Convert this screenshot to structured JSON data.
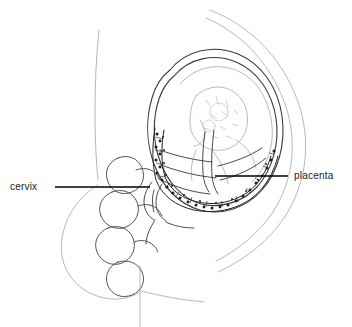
{
  "figure": {
    "width": 352,
    "height": 327,
    "background": "#ffffff",
    "style": "line-art medical illustration"
  },
  "labels": [
    {
      "id": "cervix",
      "text": "cervix",
      "side": "left",
      "text_x": 10,
      "text_y": 181,
      "leader": {
        "x1": 55,
        "y1": 187,
        "x2": 150,
        "y2": 187
      },
      "color": "#1a1a1a"
    },
    {
      "id": "placenta",
      "text": "placenta",
      "side": "right",
      "text_x": 294,
      "text_y": 170,
      "leader": {
        "x1": 215,
        "y1": 176,
        "x2": 288,
        "y2": 176
      },
      "color": "#1a1a1a"
    }
  ],
  "colors": {
    "body_outline": "#b8b8b8",
    "uterus_outline": "#3a3a3a",
    "fetus_outline": "#9a9a9a",
    "placenta_stipple": "#222222",
    "bowel_outline": "#555555",
    "leader_line": "#000000",
    "text": "#1a1a1a"
  },
  "anatomy": [
    {
      "name": "maternal-back-outline",
      "description": "faint vertical curve of maternal back, upper left"
    },
    {
      "name": "maternal-abdomen-outline",
      "description": "large arc of anterior abdominal wall, right side"
    },
    {
      "name": "buttock-outline",
      "description": "rounded curve of buttock, lower left"
    },
    {
      "name": "thigh-outline",
      "description": "faint vertical line descending to bottom edge"
    },
    {
      "name": "uterus-outline",
      "description": "double-walled oval uterine body containing fetus"
    },
    {
      "name": "fetus",
      "description": "fetal head and body in cephalic position, light stipple detail"
    },
    {
      "name": "placenta",
      "description": "dense stippled band arcing across lower uterine segment covering the internal os"
    },
    {
      "name": "cervix",
      "description": "lower uterine segment and cervical canal"
    },
    {
      "name": "bowel-loops",
      "description": "chain of rounded intestinal coils anterior to sacrum"
    },
    {
      "name": "sacrum-spine",
      "description": "posterior bony contour"
    }
  ]
}
